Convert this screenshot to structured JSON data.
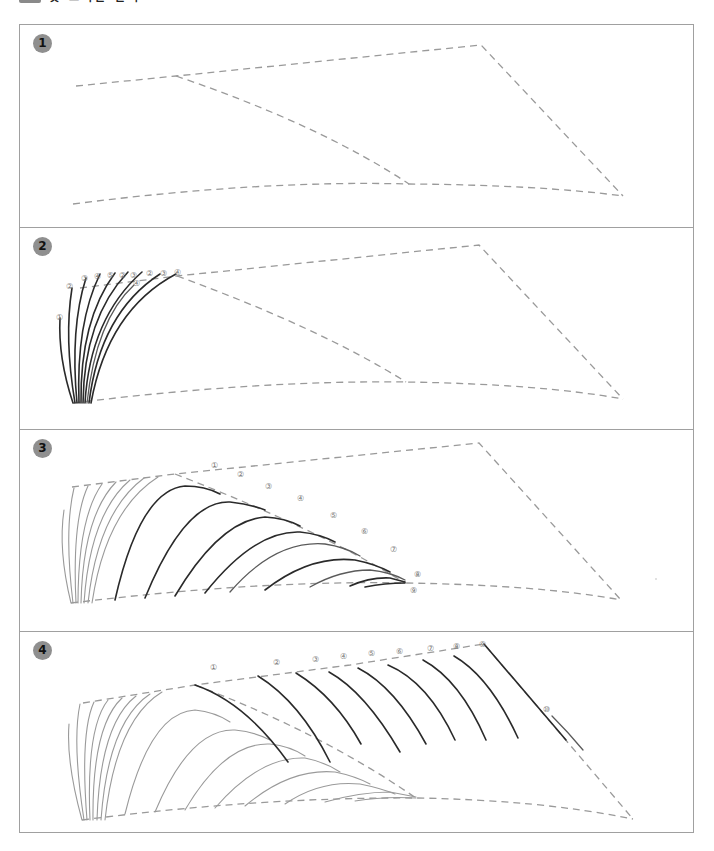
{
  "header": {
    "title": "깃 그리는 순서"
  },
  "panels": [
    {
      "step": "1",
      "description": "Guide lines: feather outline (dashed)"
    },
    {
      "step": "2",
      "description": "Draw upper-left fan of strokes",
      "labels": [
        "①",
        "②",
        "③",
        "④",
        "⑤",
        "②",
        "③",
        "④",
        "②",
        "③",
        "④"
      ]
    },
    {
      "step": "3",
      "description": "Draw arched strokes along inner guide",
      "labels": [
        "①",
        "②",
        "③",
        "④",
        "⑤",
        "⑥",
        "⑦",
        "⑧",
        "⑨"
      ]
    },
    {
      "step": "4",
      "description": "Draw diagonal strokes along top edge",
      "labels": [
        "①",
        "②",
        "③",
        "④",
        "⑤",
        "⑥",
        "⑦",
        "⑧",
        "⑨",
        "⑩"
      ]
    }
  ],
  "colors": {
    "guide": "#9a9a9a",
    "stroke": "#2a2a2a",
    "border": "#a0a0a0",
    "badge": "#8f8f8f"
  }
}
